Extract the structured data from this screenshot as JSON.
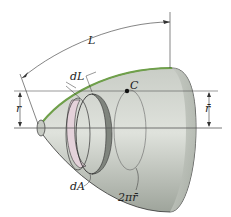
{
  "figure": {
    "labels": {
      "L": "L",
      "dL": "dL",
      "C": "C",
      "r": "r",
      "rbar": "r̄",
      "dA": "dA",
      "circumference": "2πr̄"
    },
    "colors": {
      "body_light": "#d9dcd6",
      "body_mid": "#b4b9b1",
      "body_dark": "#8c928a",
      "generating_curve": "#6fa04a",
      "ring_band": "#e4d2da",
      "ring_dark": "#7f847d",
      "line": "#333333",
      "axis": "#555555"
    }
  }
}
